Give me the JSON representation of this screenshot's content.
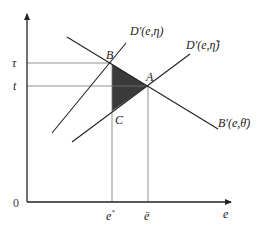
{
  "diagram": {
    "axes": {
      "x_label": "e",
      "origin_label": "0",
      "y_ticks": [
        {
          "label": "τ",
          "y": 63
        },
        {
          "label": "t",
          "y": 86
        }
      ],
      "x_ticks": [
        {
          "label": "e*",
          "base": "e",
          "sup": "*",
          "x": 112
        },
        {
          "label": "ē",
          "x": 148
        }
      ]
    },
    "curves": [
      {
        "name": "D'(e,η)",
        "label": "D′(e,η)"
      },
      {
        "name": "D'(e,η̃)",
        "label": "D′(e,η̃)"
      },
      {
        "name": "B'(e,θ̄)",
        "label": "B′(e,θ̄)"
      }
    ],
    "points": [
      {
        "label": "B"
      },
      {
        "label": "A"
      },
      {
        "label": "C"
      }
    ],
    "shaded_region": {
      "vertices": [
        "B",
        "A",
        "C"
      ],
      "color": "#3a3a3a"
    },
    "colors": {
      "axis": "#222222",
      "curve": "#222222",
      "guide": "#777777",
      "shade": "#3a3a3a"
    }
  }
}
